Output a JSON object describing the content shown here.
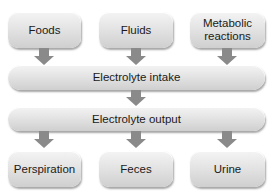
{
  "diagram": {
    "sources": [
      {
        "label": "Foods"
      },
      {
        "label": "Fluids"
      },
      {
        "label": "Metabolic reactions"
      }
    ],
    "intake": {
      "label": "Electrolyte intake"
    },
    "output": {
      "label": "Electrolyte output"
    },
    "sinks": [
      {
        "label": "Perspiration"
      },
      {
        "label": "Feces"
      },
      {
        "label": "Urine"
      }
    ],
    "colors": {
      "box_fill": "#e4e4e4",
      "arrow": "#8a8a8a",
      "text": "#1a1a1a"
    }
  }
}
